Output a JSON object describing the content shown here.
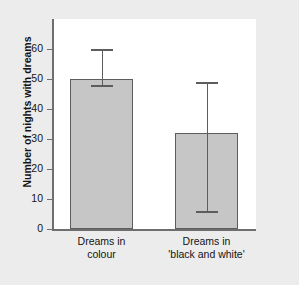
{
  "chart_data": {
    "type": "bar",
    "title": "",
    "xlabel": "",
    "ylabel": "Number of nights with dreams",
    "categories": [
      "Dreams in colour",
      "Dreams in 'black and white'"
    ],
    "category_lines": [
      [
        "Dreams in",
        "colour"
      ],
      [
        "Dreams in",
        "'black and white'"
      ]
    ],
    "values": [
      50,
      32
    ],
    "error_upper": [
      60,
      49
    ],
    "error_lower": [
      48,
      6
    ],
    "ylim": [
      0,
      70
    ],
    "yticks": [
      0,
      10,
      20,
      30,
      40,
      50,
      60
    ],
    "ytick_labels": [
      "0",
      "10",
      "20",
      "30",
      "40",
      "50",
      "60"
    ],
    "grid": false,
    "legend": false,
    "legend_position": "none",
    "bar_fill_color": "#c6c6c6",
    "bar_edge_color": "#5d5d5d",
    "axis_color": "#6e6e6e",
    "panel_background": "#ffffff",
    "figure_background": "#ececec",
    "text_color": "#141414"
  }
}
